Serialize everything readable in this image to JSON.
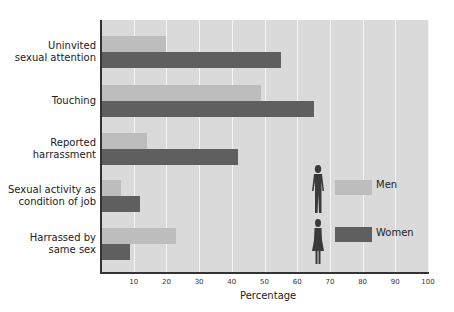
{
  "chart_data": {
    "type": "bar",
    "orientation": "horizontal",
    "title": "",
    "xlabel": "Percentage",
    "ylabel": "",
    "xlim": [
      0,
      100
    ],
    "x_ticks": [
      "10",
      "20",
      "30",
      "40",
      "50",
      "60",
      "70",
      "80",
      "90",
      "100"
    ],
    "grid": true,
    "legend_position": "inside-right",
    "categories": [
      [
        "Uninvited",
        "sexual attention"
      ],
      [
        "Touching"
      ],
      [
        "Reported",
        "harrassment"
      ],
      [
        "Sexual activity as",
        "condition of job"
      ],
      [
        "Harrassed by",
        "same sex"
      ]
    ],
    "series": [
      {
        "name": "Men",
        "color": "#bdbdbd",
        "values": [
          20,
          49,
          14,
          6,
          23
        ]
      },
      {
        "name": "Women",
        "color": "#5f5f5f",
        "values": [
          55,
          65,
          42,
          12,
          9
        ]
      }
    ]
  },
  "legend": {
    "men_label": "Men",
    "women_label": "Women",
    "men_icon": "man-figure-icon",
    "women_icon": "woman-figure-icon"
  }
}
